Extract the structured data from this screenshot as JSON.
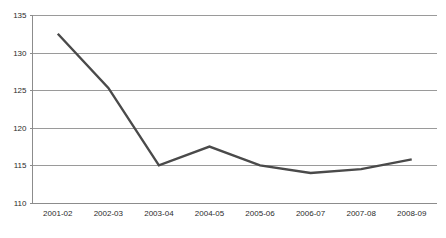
{
  "chart_data": {
    "type": "line",
    "title": "",
    "subtitle": "",
    "xlabel": "",
    "ylabel": "",
    "categories": [
      "2001-02",
      "2002-03",
      "2003-04",
      "2004-05",
      "2005-06",
      "2006-07",
      "2007-08",
      "2008-09"
    ],
    "series": [
      {
        "name": "",
        "values": [
          132.5,
          125.3,
          115.0,
          117.5,
          115.0,
          114.0,
          114.5,
          115.8
        ],
        "color": "#4a4a4a"
      }
    ],
    "ylim": [
      110,
      135
    ],
    "ytick_labels": [
      "110",
      "115",
      "120",
      "125",
      "130",
      "135"
    ],
    "ytick_values": [
      110,
      115,
      120,
      125,
      130,
      135
    ],
    "grid": true,
    "grid_axis": "y",
    "grid_color": "#9a9a9a",
    "legend": false,
    "legend_position": "none",
    "markers": false,
    "background_color": "#ffffff",
    "axis_color": "#8c8c8c",
    "tick_label_color": "#2b2b2b",
    "annotations": []
  }
}
